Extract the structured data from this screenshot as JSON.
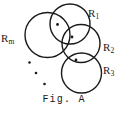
{
  "figure": {
    "caption": "Fig. A",
    "background_color": "#ffffff",
    "stroke_color": "#1a1a1a",
    "labels": {
      "rm": {
        "base": "R",
        "sub": "m"
      },
      "r1": {
        "base": "R",
        "sub": "1"
      },
      "r2": {
        "base": "R",
        "sub": "2"
      },
      "r3": {
        "base": "R",
        "sub": "3"
      }
    },
    "circles": [
      {
        "name": "circle-rm",
        "cx": 47.5,
        "cy": 35.0,
        "r": 22.5
      },
      {
        "name": "circle-r1",
        "cx": 70.0,
        "cy": 24.0,
        "r": 20.0
      },
      {
        "name": "circle-r2",
        "cx": 81.0,
        "cy": 43.5,
        "r": 19.0
      },
      {
        "name": "circle-r3",
        "cx": 81.5,
        "cy": 73.0,
        "r": 20.0
      }
    ],
    "lens_dots": [
      {
        "name": "lens-dot-rm-r1",
        "cx": 57.5,
        "cy": 24.5,
        "r": 1.4
      },
      {
        "name": "lens-dot-r1-r2",
        "cx": 72.0,
        "cy": 37.0,
        "r": 1.4
      },
      {
        "name": "lens-dot-r2-r3",
        "cx": 76.0,
        "cy": 60.0,
        "r": 1.4
      }
    ],
    "ellipsis_dots": [
      {
        "name": "ellipsis-dot-1",
        "cx": 29.5,
        "cy": 62.5,
        "r": 1.3
      },
      {
        "name": "ellipsis-dot-2",
        "cx": 36.0,
        "cy": 73.0,
        "r": 1.3
      },
      {
        "name": "ellipsis-dot-3",
        "cx": 44.5,
        "cy": 84.0,
        "r": 1.3
      }
    ]
  }
}
